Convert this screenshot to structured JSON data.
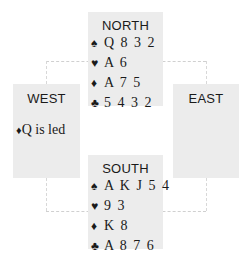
{
  "diagram": {
    "type": "bridge-hand",
    "colors": {
      "box_bg": "#ececec",
      "text": "#1a1a1a",
      "connector": "#d0d0d0"
    },
    "north": {
      "title": "NORTH",
      "spades": {
        "icon": "♠",
        "cards": "Q 8 3 2"
      },
      "hearts": {
        "icon": "♥",
        "cards": "A 6"
      },
      "diamonds": {
        "icon": "♦",
        "cards": "A 7 5"
      },
      "clubs": {
        "icon": "♣",
        "cards": "5 4 3 2"
      }
    },
    "west": {
      "title": "WEST",
      "lead": {
        "icon": "♦",
        "text": "Q is led"
      }
    },
    "east": {
      "title": "EAST"
    },
    "south": {
      "title": "SOUTH",
      "spades": {
        "icon": "♠",
        "cards": "A K J 5 4"
      },
      "hearts": {
        "icon": "♥",
        "cards": "9 3"
      },
      "diamonds": {
        "icon": "♦",
        "cards": "K 8"
      },
      "clubs": {
        "icon": "♣",
        "cards": "A 8 7 6"
      }
    }
  }
}
